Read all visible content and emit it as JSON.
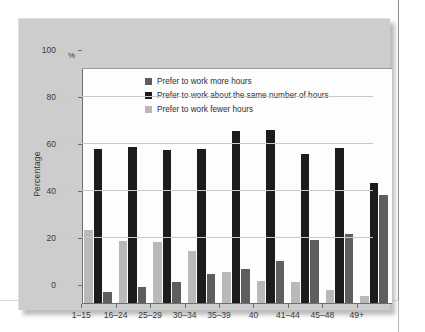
{
  "chart_data": {
    "type": "bar",
    "title": "",
    "subtitle": "",
    "xlabel": "",
    "ylabel": "Percentage",
    "unit_symbol": "%",
    "ylim": [
      0,
      100
    ],
    "yticks": [
      0,
      20,
      40,
      60,
      80,
      100
    ],
    "grid": true,
    "legend_position": "inside-top-left",
    "categories": [
      "1–15",
      "16–24",
      "25–29",
      "30–34",
      "35–39",
      "40",
      "41–44",
      "45–48",
      "49+"
    ],
    "bar_order_in_group": [
      "Prefer to work fewer hours",
      "Prefer to work about the same number of hours",
      "Prefer to work more hours"
    ],
    "series": [
      {
        "name": "Prefer to work more hours",
        "color": "#5e5e5e",
        "values": [
          4.5,
          7.0,
          9.0,
          12.5,
          14.5,
          18.0,
          27.0,
          29.5,
          46.0
        ]
      },
      {
        "name": "Prefer to work about the same number of hours",
        "color": "#1c1c1c",
        "values": [
          65.5,
          66.5,
          65.0,
          65.5,
          73.0,
          73.5,
          63.5,
          66.0,
          51.0
        ]
      },
      {
        "name": "Prefer to work fewer hours",
        "color": "#b9b9b9",
        "values": [
          31.0,
          26.5,
          26.0,
          22.0,
          13.0,
          9.5,
          9.0,
          5.5,
          3.0
        ]
      }
    ]
  },
  "legend": {
    "items": [
      {
        "label": "Prefer to work more hours",
        "color": "#5e5e5e"
      },
      {
        "label": "Prefer to work about the same number of hours",
        "color": "#1c1c1c"
      },
      {
        "label": "Prefer to work fewer hours",
        "color": "#b9b9b9"
      }
    ]
  },
  "colors": {
    "panel_background": "#cdcdcd",
    "plot_background": "#fdfdfd",
    "axis": "#6e6e6e",
    "gridline": "#c9c9c9",
    "text": "#3a3a3a",
    "page_background": "#ffffff"
  }
}
